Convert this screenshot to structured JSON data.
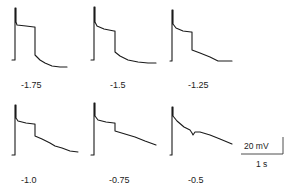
{
  "chart_data": {
    "type": "line",
    "title": "",
    "layout": {
      "rows": 2,
      "cols": 3,
      "grid": false,
      "legend": "none"
    },
    "scale_bar": {
      "voltage_label": "20 mV",
      "time_label": "1 s"
    },
    "panels": [
      {
        "label": "-1.75",
        "row": 0,
        "col": 0,
        "points": [
          [
            12,
            60
          ],
          [
            15,
            60
          ],
          [
            15,
            8
          ],
          [
            16,
            8
          ],
          [
            16,
            22
          ],
          [
            17,
            25
          ],
          [
            26,
            26
          ],
          [
            34,
            27
          ],
          [
            35,
            27
          ],
          [
            35,
            55
          ],
          [
            37,
            57
          ],
          [
            40,
            60
          ],
          [
            45,
            63
          ],
          [
            52,
            66
          ],
          [
            60,
            67
          ],
          [
            67,
            67
          ]
        ]
      },
      {
        "label": "-1.5",
        "row": 0,
        "col": 1,
        "points": [
          [
            91,
            60
          ],
          [
            94,
            60
          ],
          [
            94,
            7
          ],
          [
            95,
            7
          ],
          [
            95,
            22
          ],
          [
            97,
            26
          ],
          [
            104,
            29
          ],
          [
            114,
            31
          ],
          [
            115,
            31
          ],
          [
            115,
            52
          ],
          [
            120,
            56
          ],
          [
            128,
            60
          ],
          [
            138,
            62
          ],
          [
            148,
            63
          ],
          [
            156,
            63
          ]
        ]
      },
      {
        "label": "-1.25",
        "row": 0,
        "col": 2,
        "points": [
          [
            170,
            61
          ],
          [
            172,
            61
          ],
          [
            172,
            10
          ],
          [
            173,
            10
          ],
          [
            173,
            24
          ],
          [
            176,
            28
          ],
          [
            183,
            31
          ],
          [
            191,
            32
          ],
          [
            192,
            32
          ],
          [
            192,
            50
          ],
          [
            200,
            53
          ],
          [
            210,
            57
          ],
          [
            218,
            61
          ],
          [
            225,
            61
          ],
          [
            232,
            61
          ]
        ]
      },
      {
        "label": "-1.0",
        "row": 1,
        "col": 0,
        "points": [
          [
            12,
            155
          ],
          [
            15,
            155
          ],
          [
            15,
            105
          ],
          [
            16,
            105
          ],
          [
            16,
            118
          ],
          [
            18,
            121
          ],
          [
            26,
            123
          ],
          [
            34,
            124
          ],
          [
            35,
            124
          ],
          [
            35,
            136
          ],
          [
            42,
            139
          ],
          [
            50,
            143
          ],
          [
            55,
            146
          ],
          [
            62,
            148
          ],
          [
            70,
            151
          ],
          [
            78,
            152
          ]
        ]
      },
      {
        "label": "-0.75",
        "row": 1,
        "col": 1,
        "points": [
          [
            91,
            155
          ],
          [
            94,
            155
          ],
          [
            94,
            103
          ],
          [
            95,
            103
          ],
          [
            95,
            116
          ],
          [
            98,
            120
          ],
          [
            106,
            122
          ],
          [
            114,
            123
          ],
          [
            115,
            123
          ],
          [
            115,
            131
          ],
          [
            125,
            134
          ],
          [
            135,
            137
          ],
          [
            145,
            141
          ],
          [
            156,
            145
          ]
        ]
      },
      {
        "label": "-0.5",
        "row": 1,
        "col": 2,
        "points": [
          [
            170,
            155
          ],
          [
            172,
            155
          ],
          [
            172,
            107
          ],
          [
            173,
            107
          ],
          [
            173,
            116
          ],
          [
            177,
            121
          ],
          [
            184,
            127
          ],
          [
            190,
            130
          ],
          [
            192,
            133
          ],
          [
            193,
            135
          ],
          [
            195,
            132
          ],
          [
            200,
            132
          ],
          [
            210,
            135
          ],
          [
            220,
            139
          ],
          [
            232,
            144
          ]
        ]
      }
    ],
    "xlabel": "",
    "ylabel": ""
  },
  "figure": {
    "labels": [
      "-1.75",
      "-1.5",
      "-1.25",
      "-1.0",
      "-0.75",
      "-0.5"
    ],
    "scale_voltage": "20 mV",
    "scale_time": "1 s"
  }
}
